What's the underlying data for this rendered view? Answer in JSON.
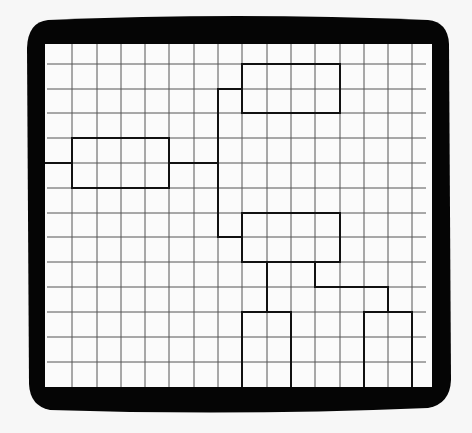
{
  "diagram": {
    "type": "tree-hierarchy-on-grid",
    "colors": {
      "background": "#f7f7f7",
      "frame": "#050505",
      "screen": "#fbfbfb",
      "grid": "#555555",
      "boxes": "#111111"
    },
    "frame": {
      "description": "thick black rounded monitor/screen bezel",
      "outer": {
        "x": 27,
        "y": 18,
        "w": 420,
        "h": 392
      },
      "inner": {
        "x": 45,
        "y": 44,
        "w": 387,
        "h": 343
      }
    },
    "grid": {
      "vertical_lines_x": [
        72,
        97,
        121,
        145,
        169,
        194,
        218,
        242,
        267,
        291,
        315,
        340,
        364,
        388,
        412
      ],
      "horizontal_lines_y": [
        64,
        89,
        113,
        138,
        163,
        188,
        213,
        237,
        262,
        287,
        312,
        337,
        362
      ]
    },
    "boxes": [
      {
        "id": "root",
        "x": 72,
        "y": 138,
        "w": 97,
        "h": 50
      },
      {
        "id": "child-top",
        "x": 242,
        "y": 64,
        "w": 98,
        "h": 49
      },
      {
        "id": "child-middle",
        "x": 242,
        "y": 213,
        "w": 98,
        "h": 49
      },
      {
        "id": "leaf-left",
        "x": 242,
        "y": 312,
        "w": 49,
        "h": 75,
        "open_bottom": true
      },
      {
        "id": "leaf-right",
        "x": 364,
        "y": 312,
        "w": 48,
        "h": 75,
        "open_bottom": true
      }
    ],
    "connectors": [
      {
        "id": "input-line",
        "points": [
          [
            45,
            163
          ],
          [
            72,
            163
          ]
        ]
      },
      {
        "id": "root-to-trunk",
        "points": [
          [
            169,
            163
          ],
          [
            218,
            163
          ]
        ]
      },
      {
        "id": "trunk-to-top",
        "points": [
          [
            218,
            163
          ],
          [
            218,
            89
          ],
          [
            242,
            89
          ]
        ]
      },
      {
        "id": "trunk-to-middle",
        "points": [
          [
            218,
            163
          ],
          [
            218,
            237
          ],
          [
            242,
            237
          ]
        ]
      },
      {
        "id": "middle-to-leaf-left",
        "points": [
          [
            267,
            262
          ],
          [
            267,
            312
          ]
        ]
      },
      {
        "id": "middle-to-leaf-right",
        "points": [
          [
            315,
            262
          ],
          [
            315,
            287
          ],
          [
            388,
            287
          ],
          [
            388,
            312
          ]
        ]
      }
    ]
  }
}
